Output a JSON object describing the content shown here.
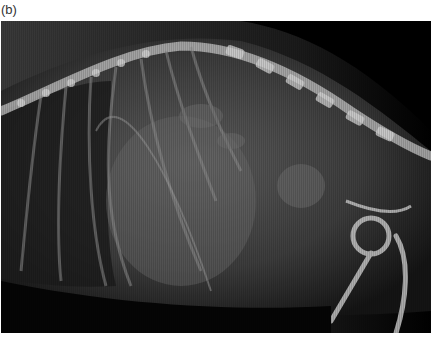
{
  "figure": {
    "panel_label": "(b)",
    "image": {
      "kind": "lateral radiograph",
      "subject": "canine thorax/abdomen, lateral view",
      "colors": {
        "background": "#000000",
        "soft_tissue": "#4a4a4a",
        "bone": "#c8c8c8",
        "page": "#ffffff"
      }
    }
  }
}
